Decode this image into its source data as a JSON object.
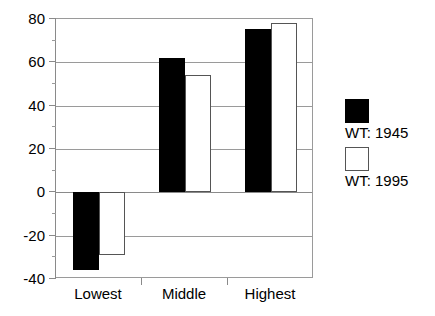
{
  "chart_data": {
    "type": "bar",
    "title": "",
    "xlabel": "",
    "ylabel": "",
    "categories": [
      "Lowest",
      "Middle",
      "Highest"
    ],
    "series": [
      {
        "name": "WT: 1945",
        "color": "#000000",
        "fill": "solid-black",
        "values": [
          -36,
          62,
          75.5
        ]
      },
      {
        "name": "WT: 1995",
        "color": "#ffffff",
        "fill": "white-outline",
        "values": [
          -29,
          54,
          78
        ]
      }
    ],
    "ylim": [
      -40,
      80
    ],
    "ytick_labels": [
      "80",
      "60",
      "40",
      "20",
      "0",
      "-20",
      "-40"
    ],
    "ytick_values": [
      80,
      60,
      40,
      20,
      0,
      -20,
      -40
    ],
    "yminor_values": [
      70,
      50,
      30,
      10,
      -10,
      -30
    ],
    "grid": "horizontal",
    "zero_line": 0,
    "legend_position": "right",
    "legend": [
      "WT: 1945",
      "WT: 1995"
    ]
  }
}
